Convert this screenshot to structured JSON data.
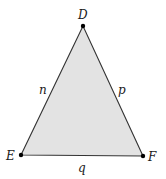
{
  "diagram": {
    "type": "triangle",
    "fill_color": "#e3e3e3",
    "stroke_color": "#333333",
    "vertices": [
      {
        "label": "D",
        "x": 83,
        "y": 26
      },
      {
        "label": "E",
        "x": 21,
        "y": 155
      },
      {
        "label": "F",
        "x": 143,
        "y": 156
      }
    ],
    "sides": [
      {
        "label": "n",
        "between": "D-E"
      },
      {
        "label": "p",
        "between": "D-F"
      },
      {
        "label": "q",
        "between": "E-F"
      }
    ]
  }
}
